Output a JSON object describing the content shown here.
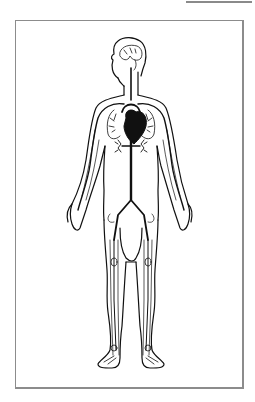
{
  "figure": {
    "style": "black line drawing on white",
    "parts": [
      "brain-icon",
      "heart-icon",
      "lungs-icon",
      "aorta-icon",
      "kidneys-icon",
      "arteries-icon",
      "veins-icon"
    ]
  },
  "colors": {
    "background": "#ffffff",
    "ink": "#111111",
    "frame": "#8c8c8c"
  }
}
